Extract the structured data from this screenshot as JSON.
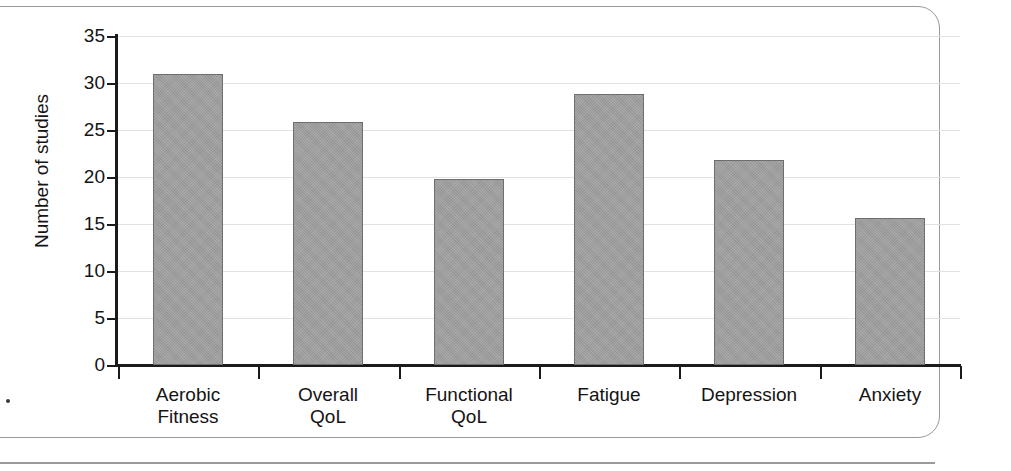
{
  "figure": {
    "frame_color": "#9a9a9a",
    "background": "#ffffff"
  },
  "chart_data": {
    "type": "bar",
    "title": "",
    "xlabel": "",
    "ylabel": "Number of studies",
    "categories": [
      "Aerobic\nFitness",
      "Overall\nQoL",
      "Functional\nQoL",
      "Fatigue",
      "Depression",
      "Anxiety"
    ],
    "values": [
      31.0,
      25.9,
      19.8,
      28.8,
      21.8,
      15.6
    ],
    "ylim": [
      0,
      35
    ],
    "yticks": [
      0,
      5,
      10,
      15,
      20,
      25,
      30,
      35
    ],
    "ytick_labels": [
      "0",
      "5",
      "10",
      "15",
      "20",
      "25",
      "30",
      "35"
    ],
    "grid": true,
    "grid_axis": "y",
    "legend": null,
    "bar_fill": "#9d9d9d",
    "bar_edge": "#6e6e6e",
    "axis_color": "#1b1b1b",
    "gridline_color": "#e2e2e2"
  }
}
